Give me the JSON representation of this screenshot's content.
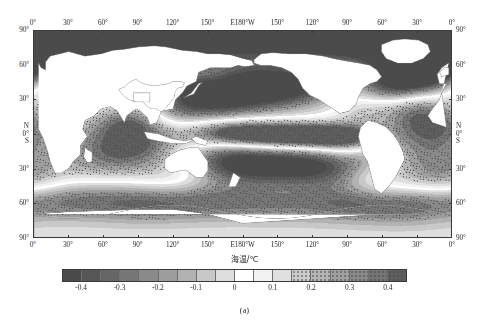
{
  "figure": {
    "caption": "(a)",
    "panel_label": "(a)"
  },
  "chart_data": {
    "type": "heatmap",
    "title": "",
    "subtitle": "",
    "xlabel": "",
    "ylabel": "",
    "projection": "cylindrical-equidistant",
    "grid": false,
    "legend_position": "bottom",
    "variable_label": "海温/℃",
    "variable_name_en": "Sea surface temperature anomaly",
    "units": "°C",
    "xlim": [
      0,
      360
    ],
    "ylim": [
      -90,
      90
    ],
    "x_tick_labels": [
      "0°",
      "30°",
      "60°",
      "90°",
      "120°",
      "150°",
      "E180°W",
      "150°",
      "120°",
      "90°",
      "60°",
      "30°",
      "0°"
    ],
    "x_tick_values": [
      0,
      30,
      60,
      90,
      120,
      150,
      180,
      210,
      240,
      270,
      300,
      330,
      360
    ],
    "y_tick_labels": [
      "90°",
      "60°",
      "30°",
      "0°",
      "30°",
      "60°",
      "90°"
    ],
    "y_tick_values": [
      90,
      60,
      30,
      0,
      -30,
      -60,
      -90
    ],
    "y_hemisphere_north": "N",
    "y_hemisphere_south": "S",
    "y_equator_label": "0°",
    "colorbar": {
      "tick_labels": [
        "-0.4",
        "-0.3",
        "-0.2",
        "-0.1",
        "0",
        "0.1",
        "0.2",
        "0.3",
        "0.4"
      ],
      "tick_values": [
        -0.4,
        -0.3,
        -0.2,
        -0.1,
        0,
        0.1,
        0.2,
        0.3,
        0.4
      ],
      "vmin": -0.45,
      "vmax": 0.45,
      "n_levels": 18,
      "level_bounds": [
        -0.45,
        -0.4,
        -0.35,
        -0.3,
        -0.25,
        -0.2,
        -0.15,
        -0.1,
        -0.05,
        0,
        0.05,
        0.1,
        0.15,
        0.2,
        0.25,
        0.3,
        0.35,
        0.4,
        0.45
      ],
      "colors": [
        "#4b4b4b",
        "#575757",
        "#666666",
        "#767676",
        "#8a8a8a",
        "#9d9d9d",
        "#b2b2b2",
        "#c8c8c8",
        "#dedede",
        "#ffffff",
        "#f2f2f2",
        "#e0e0e0",
        "#cccccc",
        "#b6b6b6",
        "#a0a0a0",
        "#8a8a8a",
        "#757575",
        "#5e5e5e"
      ],
      "stippled_cells": [
        12,
        13,
        14,
        15,
        16,
        17
      ],
      "stipple_meaning": "significance-hatching"
    },
    "features": [
      {
        "name": "Arctic Ocean cold anomaly",
        "lon_range": [
          0,
          360
        ],
        "lat_range": [
          66,
          90
        ],
        "value": -0.35,
        "stippled": true
      },
      {
        "name": "North Atlantic cold anomaly",
        "lon_range": [
          300,
          350
        ],
        "lat_range": [
          35,
          65
        ],
        "value": -0.4,
        "stippled": true
      },
      {
        "name": "Subtropical North Atlantic warm anomaly",
        "lon_range": [
          310,
          345
        ],
        "lat_range": [
          15,
          35
        ],
        "value": 0.25,
        "stippled": true
      },
      {
        "name": "Equatorial Pacific warm tongue",
        "lon_range": [
          150,
          280
        ],
        "lat_range": [
          -10,
          10
        ],
        "value": 0.3,
        "stippled": true
      },
      {
        "name": "North Pacific horseshoe cold anomaly",
        "lon_range": [
          140,
          230
        ],
        "lat_range": [
          20,
          50
        ],
        "value": -0.25,
        "stippled": true
      },
      {
        "name": "South Pacific cold anomaly",
        "lon_range": [
          170,
          250
        ],
        "lat_range": [
          -45,
          -15
        ],
        "value": -0.2,
        "stippled": true
      },
      {
        "name": "Indian Ocean warm anomaly",
        "lon_range": [
          50,
          110
        ],
        "lat_range": [
          -25,
          15
        ],
        "value": 0.2,
        "stippled": true
      },
      {
        "name": "Southern Ocean mixed anomalies",
        "lon_range": [
          0,
          360
        ],
        "lat_range": [
          -70,
          -45
        ],
        "value": -0.15,
        "stippled": true
      },
      {
        "name": "Mediterranean warm anomaly",
        "lon_range": [
          0,
          40
        ],
        "lat_range": [
          30,
          45
        ],
        "value": 0.15,
        "stippled": false
      },
      {
        "name": "Land mask",
        "value": null,
        "color": "#ffffff"
      }
    ]
  }
}
